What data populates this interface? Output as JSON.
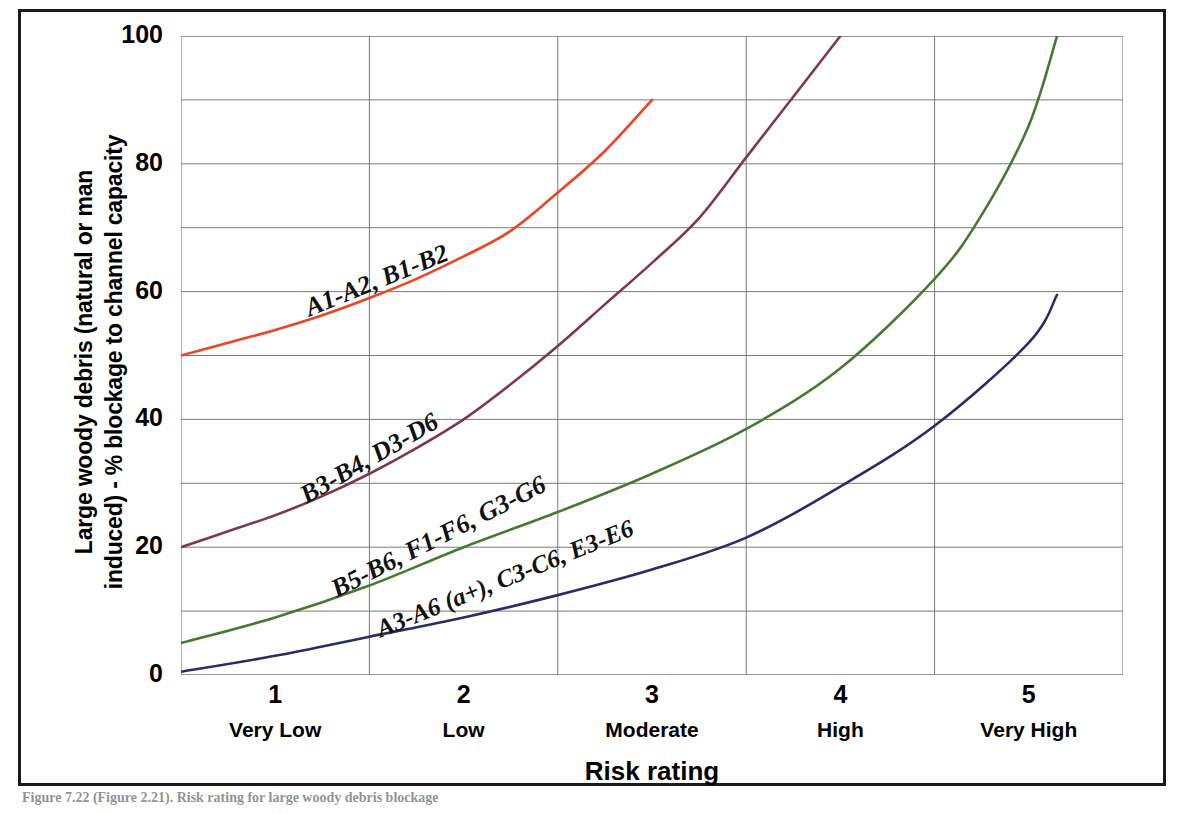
{
  "figure": {
    "caption": "Figure 7.22 (Figure 2.21). Risk rating for large woody debris blockage"
  },
  "chart_data": {
    "type": "line",
    "title": "",
    "xlabel": "Risk rating",
    "ylabel": "Large woody debris (natural or man induced) - % blockage to channel capacity",
    "ylabel_lines": [
      "Large woody debris (natural or man",
      "induced) - % blockage to channel capacity"
    ],
    "xlim": [
      0.5,
      5.5
    ],
    "ylim": [
      0,
      100
    ],
    "grid": true,
    "legend_position": "inline-on-curve",
    "y_ticks": [
      0,
      20,
      40,
      60,
      80,
      100
    ],
    "y_tick_labels": [
      "0",
      "20",
      "40",
      "60",
      "80",
      "100"
    ],
    "y_gridlines": [
      0,
      10,
      20,
      30,
      40,
      50,
      60,
      70,
      80,
      90,
      100
    ],
    "x_ticks": [
      1,
      2,
      3,
      4,
      5
    ],
    "x_tick_labels": [
      "1",
      "2",
      "3",
      "4",
      "5"
    ],
    "x_category_labels": [
      "Very Low",
      "Low",
      "Moderate",
      "High",
      "Very High"
    ],
    "x_gridlines": [
      0.5,
      1.5,
      2.5,
      3.5,
      4.5
    ],
    "series": [
      {
        "name": "A1-A2, B1-B2",
        "color": "#EE4422",
        "label_angle": -22,
        "x": [
          0.5,
          0.75,
          1.0,
          1.25,
          1.5,
          1.75,
          2.0,
          2.25,
          2.5,
          2.75,
          3.0
        ],
        "values": [
          50.0,
          52.0,
          54.0,
          56.3,
          59.0,
          62.0,
          65.5,
          69.5,
          75.5,
          82.0,
          90.0
        ]
      },
      {
        "name": "B3-B4, D3-D6",
        "color": "#7D3A4E",
        "label_angle": -30,
        "x": [
          0.5,
          0.75,
          1.0,
          1.25,
          1.5,
          1.75,
          2.0,
          2.25,
          2.5,
          2.75,
          3.0,
          3.25,
          3.5,
          3.75,
          4.0
        ],
        "values": [
          20.0,
          22.5,
          25.0,
          28.0,
          31.5,
          35.5,
          40.0,
          45.5,
          51.5,
          58.0,
          64.5,
          71.5,
          81.0,
          90.5,
          100.0
        ]
      },
      {
        "name": "B5-B6, F1-F6, G3-G6",
        "color": "#477A31",
        "label_angle": -27,
        "x": [
          0.5,
          1.0,
          1.5,
          2.0,
          2.5,
          3.0,
          3.5,
          4.0,
          4.5,
          4.75,
          5.0,
          5.15
        ],
        "values": [
          5.0,
          9.0,
          14.0,
          20.0,
          25.5,
          31.5,
          38.5,
          48.0,
          62.0,
          72.0,
          86.0,
          100.0
        ]
      },
      {
        "name": "A3-A6 (a+), C3-C6, E3-E6",
        "color": "#2B2B68",
        "label_angle": -22,
        "x": [
          0.5,
          1.0,
          1.5,
          2.0,
          2.5,
          3.0,
          3.5,
          4.0,
          4.5,
          5.0,
          5.15
        ],
        "values": [
          0.5,
          3.0,
          6.0,
          9.0,
          12.5,
          16.5,
          21.5,
          29.5,
          39.0,
          52.0,
          59.5
        ]
      }
    ]
  }
}
